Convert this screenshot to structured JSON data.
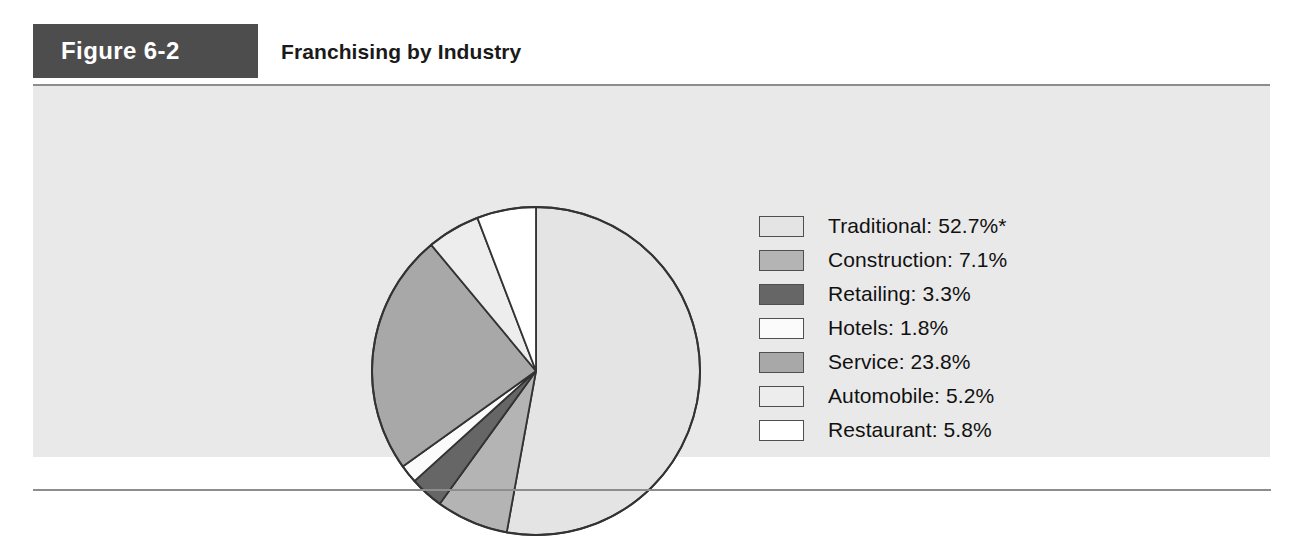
{
  "figure": {
    "tag": "Figure 6-2",
    "title": "Franchising by Industry"
  },
  "colors": {
    "tag_background": "#4d4d4d",
    "panel_background": "#e9e9e9",
    "rule": "#8d8d8d",
    "slice_outline": "#333333"
  },
  "legend": {
    "items": [
      {
        "label": "Traditional: 52.7%*",
        "swatch": "#e4e4e4"
      },
      {
        "label": "Construction: 7.1%",
        "swatch": "#b4b4b4"
      },
      {
        "label": "Retailing: 3.3%",
        "swatch": "#666666"
      },
      {
        "label": "Hotels: 1.8%",
        "swatch": "#fbfbfb"
      },
      {
        "label": "Service: 23.8%",
        "swatch": "#a8a8a8"
      },
      {
        "label": "Automobile: 5.2%",
        "swatch": "#ededed"
      },
      {
        "label": "Restaurant: 5.8%",
        "swatch": "#ffffff"
      }
    ]
  },
  "chart_data": {
    "type": "pie",
    "title": "Franchising by Industry",
    "unit": "percent",
    "start_angle_deg": 0,
    "direction": "clockwise",
    "legend_position": "right",
    "labels": [
      "Traditional",
      "Construction",
      "Retailing",
      "Hotels",
      "Service",
      "Automobile",
      "Restaurant"
    ],
    "values": [
      52.7,
      7.1,
      3.3,
      1.8,
      23.8,
      5.2,
      5.8
    ],
    "slice_colors": [
      "#e4e4e4",
      "#b4b4b4",
      "#666666",
      "#fbfbfb",
      "#a8a8a8",
      "#ededed",
      "#ffffff"
    ],
    "footnote_marker": "*",
    "total": 99.7
  },
  "geometry": {
    "center_x": 173,
    "center_y": 178,
    "radius": 164
  }
}
